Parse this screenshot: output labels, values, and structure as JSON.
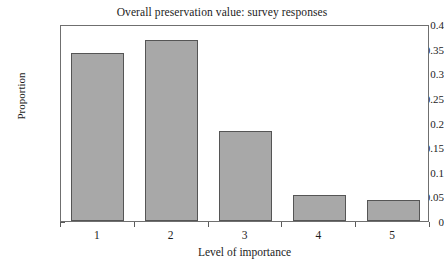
{
  "chart_data": {
    "type": "bar",
    "title": "Overall preservation value: survey responses",
    "xlabel": "Level of importance",
    "ylabel": "Proportion",
    "categories": [
      "1",
      "2",
      "3",
      "4",
      "5"
    ],
    "values": [
      0.341,
      0.368,
      0.183,
      0.053,
      0.043
    ],
    "ylim": [
      0,
      0.4
    ],
    "ytick_values": [
      0,
      0.05,
      0.1,
      0.15,
      0.2,
      0.25,
      0.3,
      0.35,
      0.4
    ],
    "ytick_labels": [
      "0",
      "0.05",
      "0.1",
      "0.15",
      "0.2",
      "0.25",
      "0.3",
      "0.35",
      "0.4"
    ],
    "grid": false,
    "legend": null,
    "bar_color": "#a8a8a8",
    "bar_edge_color": "#555555",
    "axis_color": "#6f6f6f",
    "background_color": "#ffffff"
  }
}
